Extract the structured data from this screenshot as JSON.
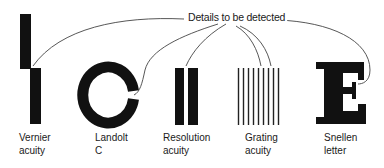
{
  "title": "Details to be detected",
  "labels": {
    "vernier": "Vernier\nacuity",
    "landolt": "Landolt\nC",
    "resolution": "Resolution\nacuity",
    "grating": "Grating\nacuity",
    "snellen": "Snellen\nletter"
  },
  "colors": {
    "ink": "#111111",
    "line": "#333333",
    "background": "#ffffff"
  }
}
